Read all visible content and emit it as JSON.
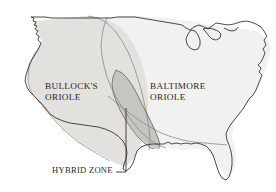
{
  "figure": {
    "kind": "range-map",
    "region_depicted": "contiguous United States",
    "background_color": "#ffffff",
    "outline_color": "#3a3632"
  },
  "map": {
    "outline_name": "united-states-outline",
    "great_lakes_name": "great-lakes",
    "coastline_color": "#3a3632"
  },
  "ranges": [
    {
      "id": "bullocks",
      "label": "BULLOCK'S\nORIOLE",
      "label_line1": "BULLOCK'S",
      "label_line2": "ORIOLE",
      "fill_color": "#e2e1de",
      "border_color": "#8d8a85",
      "position": "western United States"
    },
    {
      "id": "baltimore",
      "label": "BALTIMORE\nORIOLE",
      "label_line1": "BALTIMORE",
      "label_line2": "ORIOLE",
      "fill_color": "#f1f1ef",
      "border_color": "#8d8a85",
      "position": "eastern United States"
    },
    {
      "id": "hybrid",
      "label": "HYBRID ZONE",
      "fill_color": "#c6c5c1",
      "border_color": "#6f6c68",
      "position": "Great Plains overlap band"
    }
  ],
  "labels": {
    "bullocks": "BULLOCK'S\nORIOLE",
    "baltimore": "BALTIMORE\nORIOLE",
    "hybrid": "HYBRID ZONE"
  },
  "annotations": [
    {
      "name": "hybrid-zone-leader",
      "from": "HYBRID ZONE",
      "points_to": "hybrid overlap band",
      "line_color": "#3a3632"
    }
  ],
  "colors": {
    "text": "#2a2622",
    "outline": "#3a3632",
    "bullocks_fill": "#e2e1de",
    "baltimore_fill": "#f1f1ef",
    "hybrid_fill": "#c6c5c1",
    "range_border": "#8d8a85",
    "background": "#ffffff"
  }
}
